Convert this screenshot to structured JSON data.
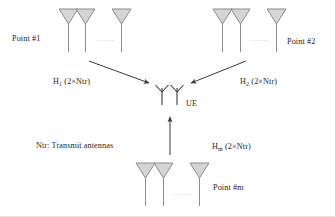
{
  "figure": {
    "background_color": "#ffffff",
    "line_color": "#4d4d4d",
    "text_color": "#262626",
    "antenna_fill": "#d4d4d4",
    "antenna_stroke": "#8c8c8c",
    "ellipsis": "······"
  },
  "labels": {
    "point1": "Point #1",
    "point2": "Point #2",
    "pointm": "Point #m",
    "ue": "UE",
    "legend": "Ntr: Transmit antennas",
    "h1_base": "H",
    "h1_sub": "1",
    "h1_tail": " (2×Ntr)",
    "h2_base": "H",
    "h2_sub": "2",
    "h2_tail": " (2×Ntr)",
    "hm_base": "H",
    "hm_sub": "m",
    "hm_tail": " (2×Ntr)"
  },
  "nodes": [
    {
      "id": "point1",
      "label": "Point #1",
      "antenna_count_shown": 3,
      "channel": "H1 (2×Ntr)",
      "position": "top-left"
    },
    {
      "id": "point2",
      "label": "Point #2",
      "antenna_count_shown": 3,
      "channel": "H2 (2×Ntr)",
      "position": "top-right"
    },
    {
      "id": "pointm",
      "label": "Point #m",
      "antenna_count_shown": 3,
      "channel": "Hm (2×Ntr)",
      "position": "bottom-center"
    },
    {
      "id": "ue",
      "label": "UE",
      "receive_antennas": 2,
      "position": "center"
    }
  ],
  "links": [
    {
      "from": "point1",
      "to": "ue",
      "channel": "H1 (2×Ntr)",
      "direction": "down-right"
    },
    {
      "from": "point2",
      "to": "ue",
      "channel": "H2 (2×Ntr)",
      "direction": "down-left"
    },
    {
      "from": "pointm",
      "to": "ue",
      "channel": "Hm (2×Ntr)",
      "direction": "up"
    }
  ]
}
